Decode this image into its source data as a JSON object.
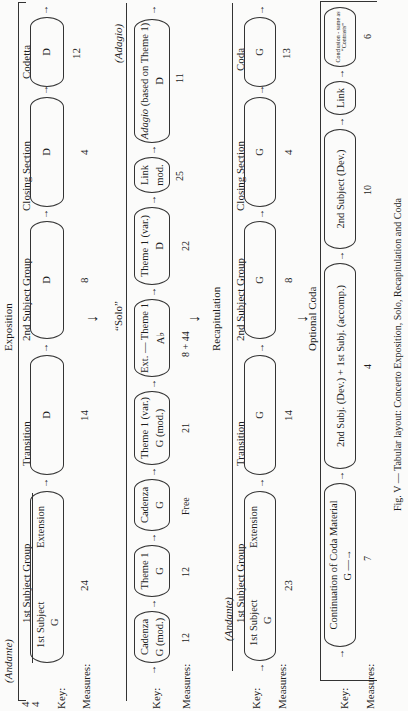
{
  "exposition": {
    "section_title": "Exposition",
    "tempo": "(Andante)",
    "time_signature": {
      "top": "4",
      "bottom": "4"
    },
    "key_label": "Key:",
    "measures_label": "Measures:",
    "groups": [
      {
        "title": "1st Subject Group",
        "sub1": "1st Subject",
        "sub2": "Extension",
        "key": "G",
        "measures": "24"
      },
      {
        "title": "Transition",
        "key": "D",
        "measures": "14"
      },
      {
        "title": "2nd Subject Group",
        "key": "D",
        "measures": "8"
      },
      {
        "title": "Closing Section",
        "key": "D",
        "measures": "4"
      },
      {
        "title": "Codetta",
        "key": "D",
        "measures": "12"
      }
    ]
  },
  "solo": {
    "section_title": "“Solo”",
    "tempo_end": "(Adagio)",
    "key_label": "Key:",
    "measures_label": "Measures:",
    "boxes": [
      {
        "title": "Cadenza",
        "key": "G (mod.)",
        "measures": "12"
      },
      {
        "title": "Theme 1",
        "key": "G",
        "measures": "12"
      },
      {
        "title": "Cadenza",
        "key": "G",
        "measures": "Free"
      },
      {
        "title": "Theme 1 (var.)",
        "key": "G (mod.)",
        "measures": "21"
      },
      {
        "title": "Ext. — Theme 1",
        "key": "A♭",
        "measures": "8 + 44"
      },
      {
        "title": "Theme 1 (var.)",
        "key": "D",
        "measures": "22"
      },
      {
        "title": "Link",
        "key": "mod.",
        "measures": "25"
      },
      {
        "title_italic": "Adagio",
        "title": " (based on Theme 1)",
        "key": "D",
        "measures": "11"
      }
    ]
  },
  "recapitulation": {
    "section_title": "Recapitulation",
    "tempo": "(Andante)",
    "key_label": "Key:",
    "measures_label": "Measures:",
    "groups": [
      {
        "title": "1st Subject Group",
        "sub1": "1st Subject",
        "sub2": "Extension",
        "key": "G",
        "measures": "23"
      },
      {
        "title": "Transition",
        "key": "G",
        "measures": "14"
      },
      {
        "title": "2nd Subject Group",
        "key": "G",
        "measures": "8"
      },
      {
        "title": "Closing Section",
        "key": "G",
        "measures": "4"
      },
      {
        "title": "Coda",
        "key": "G",
        "measures": "13"
      }
    ]
  },
  "optional_coda": {
    "section_title": "Optional Coda",
    "key_label": "Key:",
    "measures_label": "Measures:",
    "boxes": [
      {
        "title": "Continuation of Coda Material",
        "key": "G —→",
        "measures": "7"
      },
      {
        "title": "2nd Subj. (Dev.) + 1st Subj. (accomp.)",
        "measures": "4"
      },
      {
        "title": "2nd Subject (Dev.)",
        "measures": "10"
      },
      {
        "title": "Link",
        "measures": ""
      },
      {
        "title": "Conclusion - same as “Contrasts”",
        "measures": "6"
      }
    ]
  },
  "caption": "Fig. V — Tabular layout: Concerto Exposition, Solo, Recapitulation and Coda",
  "glyphs": {
    "arrow_right": "→",
    "arrow_down": "↓"
  }
}
